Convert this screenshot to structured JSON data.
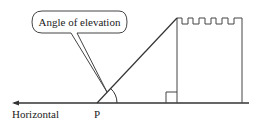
{
  "diagram": {
    "callout_label": "Angle of elevation",
    "horizontal_label": "Horizontal",
    "point_label": "P",
    "colors": {
      "stroke": "#333333",
      "text": "#222222",
      "background": "#ffffff"
    }
  }
}
